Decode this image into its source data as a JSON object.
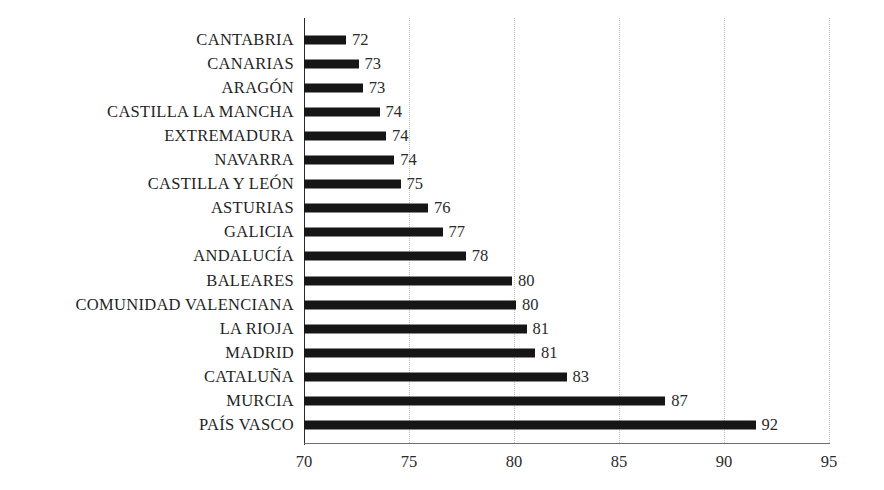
{
  "chart_data": {
    "type": "bar",
    "orientation": "horizontal",
    "title": "",
    "subtitle": "",
    "xlabel": "",
    "ylabel": "",
    "xlim": [
      70,
      95
    ],
    "xticks": [
      70,
      75,
      80,
      85,
      90,
      95
    ],
    "grid": true,
    "grid_style": "dotted vertical",
    "legend": null,
    "bar_color": "#161616",
    "label_color": "#1f1f1f",
    "gridline_color": "#b9b9b9",
    "axis_color": "#6f6f6f",
    "categories": [
      "CANTABRIA",
      "CANARIAS",
      "ARAGÓN",
      "CASTILLA LA MANCHA",
      "EXTREMADURA",
      "NAVARRA",
      "CASTILLA Y LEÓN",
      "ASTURIAS",
      "GALICIA",
      "ANDALUCÍA",
      "BALEARES",
      "COMUNIDAD VALENCIANA",
      "LA RIOJA",
      "MADRID",
      "CATALUÑA",
      "MURCIA",
      "PAÍS VASCO"
    ],
    "values": [
      72,
      73,
      73,
      74,
      74,
      74,
      75,
      76,
      77,
      78,
      80,
      80,
      81,
      81,
      83,
      87,
      92
    ],
    "bar_ends": [
      72.0,
      72.6,
      72.8,
      73.6,
      73.9,
      74.3,
      74.6,
      75.9,
      76.6,
      77.7,
      79.9,
      80.1,
      80.6,
      81.0,
      82.5,
      87.2,
      91.5
    ],
    "data_labels": [
      "72",
      "73",
      "73",
      "74",
      "74",
      "74",
      "75",
      "76",
      "77",
      "78",
      "80",
      "80",
      "81",
      "81",
      "83",
      "87",
      "92"
    ]
  }
}
